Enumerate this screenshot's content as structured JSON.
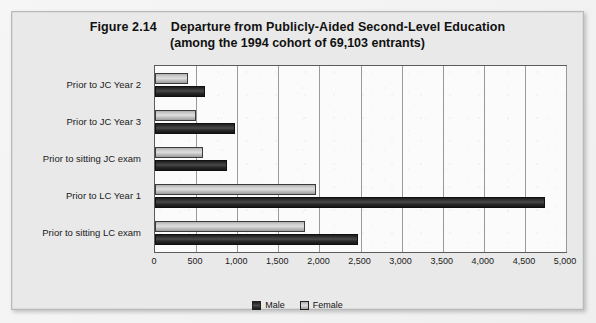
{
  "figure": {
    "number": "Figure 2.14",
    "title_line_1": "Departure from Publicly-Aided Second-Level Education",
    "title_line_2": "(among the 1994 cohort of 69,103 entrants)"
  },
  "legend": {
    "position": "bottom-center",
    "entries": [
      {
        "label": "Male",
        "swatch": "male",
        "color": "#2e2e2e"
      },
      {
        "label": "Female",
        "swatch": "female",
        "color": "#d0d0d0"
      }
    ]
  },
  "chart_data": {
    "type": "bar",
    "orientation": "horizontal",
    "subtitle": "(among the 1994 cohort of 69,103 entrants)",
    "xlabel": "",
    "ylabel": "",
    "xlim": [
      0,
      5000
    ],
    "grid": true,
    "categories": [
      "Prior to JC Year 2",
      "Prior to JC Year 3",
      "Prior to sitting JC exam",
      "Prior to LC Year 1",
      "Prior to sitting LC exam"
    ],
    "series": [
      {
        "name": "Male",
        "color": "#2e2e2e",
        "values": [
          610,
          975,
          880,
          4750,
          2475
        ]
      },
      {
        "name": "Female",
        "color": "#d0d0d0",
        "values": [
          400,
          500,
          585,
          1960,
          1830
        ]
      }
    ],
    "x_ticks": [
      {
        "value": 0,
        "label": "0"
      },
      {
        "value": 500,
        "label": "500"
      },
      {
        "value": 1000,
        "label": "1,000"
      },
      {
        "value": 1500,
        "label": "1,500"
      },
      {
        "value": 2000,
        "label": "2,000"
      },
      {
        "value": 2500,
        "label": "2,500"
      },
      {
        "value": 3000,
        "label": "3,000"
      },
      {
        "value": 3500,
        "label": "3,500"
      },
      {
        "value": 4000,
        "label": "4,000"
      },
      {
        "value": 4500,
        "label": "4,500"
      },
      {
        "value": 5000,
        "label": "5,000"
      }
    ]
  }
}
